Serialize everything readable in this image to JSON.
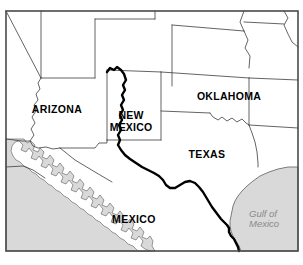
{
  "map": {
    "title": "Southwestern United States and Northern Mexico",
    "frame": {
      "stroke_color": "#4a4a4a",
      "fill_color": "#ffffff",
      "x": 6,
      "y": 11,
      "width": 292,
      "height": 240
    },
    "colors": {
      "land": "#ffffff",
      "water": "#d9d9d9",
      "water_outline": "#6e6e6e",
      "border_state": "#3c3c3c",
      "border_country": "#000000",
      "river": "#000000",
      "label_dark": "#000000",
      "label_water": "#8a8a8a"
    },
    "labels": [
      {
        "id": "arizona",
        "text": "ARIZONA",
        "x": 57,
        "y": 110,
        "style": "state"
      },
      {
        "id": "new-mexico-line1",
        "text": "NEW",
        "x": 131,
        "y": 116,
        "style": "state"
      },
      {
        "id": "new-mexico-line2",
        "text": "MEXICO",
        "x": 131,
        "y": 128,
        "style": "state"
      },
      {
        "id": "oklahoma",
        "text": "OKLAHOMA",
        "x": 229,
        "y": 97,
        "style": "state"
      },
      {
        "id": "texas",
        "text": "TEXAS",
        "x": 207,
        "y": 155,
        "style": "state"
      },
      {
        "id": "mexico",
        "text": "MEXICO",
        "x": 134,
        "y": 220,
        "style": "country"
      },
      {
        "id": "gulf-of-mexico-line1",
        "text": "Gulf of",
        "x": 249,
        "y": 214,
        "style": "water"
      },
      {
        "id": "gulf-of-mexico-line2",
        "text": "Mexico",
        "x": 249,
        "y": 224,
        "style": "water"
      }
    ],
    "features": {
      "rio_grande_name": "Rio Grande",
      "gulf_of_mexico_name": "Gulf of Mexico",
      "gulf_of_california_name": "Gulf of California",
      "pacific_ocean_name": "Pacific Ocean",
      "baja_peninsula_name": "Baja California"
    },
    "legend_note": ""
  }
}
